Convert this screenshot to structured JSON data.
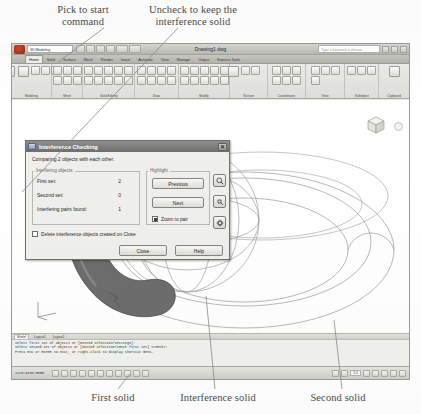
{
  "annotations": {
    "pick_to_start": "Pick to start\ncommand",
    "uncheck_to_keep": "Uncheck to keep the\ninterference solid",
    "first_solid": "First solid",
    "interference_solid": "Interference solid",
    "second_solid": "Second solid"
  },
  "app": {
    "document_title": "Drawing1.dwg",
    "logo_name": "autocad-logo",
    "quick_access": [
      "new-icon",
      "open-icon",
      "save-icon",
      "plot-icon",
      "undo-icon",
      "redo-icon"
    ],
    "workspace_selector": "3D Modeling",
    "search_placeholder": "Type a keyword or phrase",
    "window_buttons": [
      "minimize",
      "maximize",
      "close"
    ],
    "ribbon_tabs": [
      {
        "label": "Home",
        "active": true
      },
      {
        "label": "Solid",
        "active": false
      },
      {
        "label": "Surface",
        "active": false
      },
      {
        "label": "Mesh",
        "active": false
      },
      {
        "label": "Render",
        "active": false
      },
      {
        "label": "Insert",
        "active": false
      },
      {
        "label": "Annotate",
        "active": false
      },
      {
        "label": "View",
        "active": false
      },
      {
        "label": "Manage",
        "active": false
      },
      {
        "label": "Output",
        "active": false
      },
      {
        "label": "Express Tools",
        "active": false
      }
    ],
    "ribbon_panels": [
      {
        "label": "Modeling"
      },
      {
        "label": "Mesh"
      },
      {
        "label": "Solid Editing"
      },
      {
        "label": "Draw"
      },
      {
        "label": "Modify"
      },
      {
        "label": "Section"
      },
      {
        "label": "Coordinates"
      },
      {
        "label": "View"
      },
      {
        "label": "Subobject"
      },
      {
        "label": "Clipboard"
      }
    ]
  },
  "dialog": {
    "title": "Interference Checking",
    "icon_name": "interference-icon",
    "close_glyph": "✕",
    "compare_text": "Comparing 2 objects with each other.",
    "interfering_group_label": "Interfering objects",
    "highlight_group_label": "Highlight",
    "rows": [
      {
        "label": "First set:",
        "value": "2"
      },
      {
        "label": "Second set:",
        "value": "0"
      },
      {
        "label": "Interfering pairs found:",
        "value": "1"
      }
    ],
    "previous_label": "Previous",
    "next_label": "Next",
    "zoom_to_pair_label": "Zoom to pair",
    "zoom_to_pair_checked": true,
    "delete_label": "Delete interference objects created on Close",
    "delete_checked": false,
    "close_label": "Close",
    "help_label": "Help",
    "side_tools": [
      "zoom-realtime-icon",
      "pan-icon",
      "orbit-icon"
    ]
  },
  "command_area": {
    "tabs": [
      {
        "label": "Model",
        "active": true
      },
      {
        "label": "Layout1",
        "active": false
      },
      {
        "label": "Layout2",
        "active": false
      }
    ],
    "lines": [
      "Select first set of objects or [Nested selection/Settings]:",
      "Select second set of objects or [Nested selection/cHeck first set] <cHeck>:",
      "Press ESC or ENTER to exit, or right-click to display shortcut menu."
    ]
  },
  "status_bar": {
    "coordinates": "1226.6438.0000",
    "toggles": [
      "snap-icon",
      "grid-icon",
      "ortho-icon",
      "polar-icon",
      "osnap-icon",
      "otrack-icon",
      "ducs-icon",
      "dyn-icon",
      "lwt-icon",
      "qp-icon",
      "sc-icon"
    ],
    "annotation_scale": "1:1",
    "right_tools": [
      "model-space-icon",
      "quick-view-icon",
      "pan-icon",
      "zoom-icon",
      "steering-wheel-icon",
      "showmotion-icon",
      "clean-screen-icon"
    ]
  },
  "canvas": {
    "viewcube_name": "viewcube",
    "ucs_icon_name": "ucs-icon",
    "solid_fill_color": "#6d6d6d",
    "wireframe_color": "#8d8d8d"
  }
}
